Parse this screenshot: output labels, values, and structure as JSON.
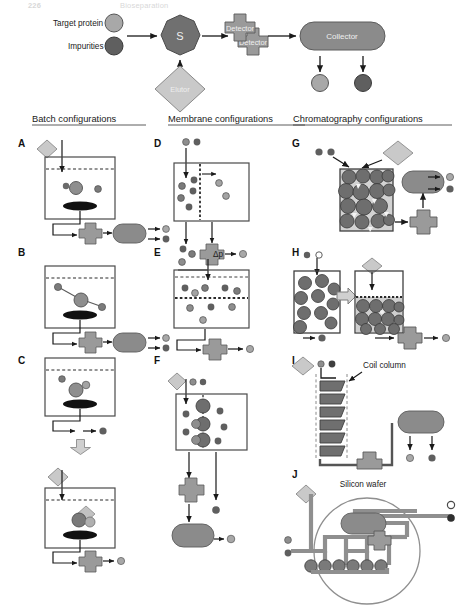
{
  "header": {
    "page_number": "226",
    "running_title": "Bioseparation"
  },
  "legend": {
    "target_protein_label": "Target protein",
    "impurities_label": "Impurities",
    "separator_label": "S",
    "detector_label": "Detector",
    "detector_label_2": "Detector",
    "collector_label": "Collector",
    "elutor_label": "Elutor"
  },
  "columns": [
    {
      "id": "batch",
      "title": "Batch configurations"
    },
    {
      "id": "membrane",
      "title": "Membrane configurations"
    },
    {
      "id": "chromatography",
      "title": "Chromatography configurations"
    }
  ],
  "panels": [
    {
      "id": "A",
      "label": "A",
      "column": "batch",
      "caption": "Stirred batch vessel with elutor addition, magnetic settling bar, detector and collector"
    },
    {
      "id": "B",
      "label": "B",
      "column": "batch",
      "caption": "Batch vessel with particle aggregation chain, magnet, detector and collector"
    },
    {
      "id": "C",
      "label": "C",
      "column": "batch",
      "caption": "Two-stage batch: wash stage then elution stage with detector"
    },
    {
      "id": "D",
      "label": "D",
      "column": "membrane",
      "caption": "Cross-flow membrane module with vertical membrane and detector"
    },
    {
      "id": "E",
      "label": "E",
      "column": "membrane",
      "caption": "Dead-end membrane filtration driven by pressure difference",
      "annotation": "Δp"
    },
    {
      "id": "F",
      "label": "F",
      "column": "membrane",
      "caption": "Membrane adsorber column with bound particle clusters, detector and collector"
    },
    {
      "id": "G",
      "label": "G",
      "column": "chromatography",
      "caption": "Packed bed chromatography column with detector and collector"
    },
    {
      "id": "H",
      "label": "H",
      "column": "chromatography",
      "caption": "Expanded bed converted to settled packed bed, then detector"
    },
    {
      "id": "I",
      "label": "I",
      "column": "chromatography",
      "caption": "Coil column chromatography with detector and collector",
      "annotation": "Coil column"
    },
    {
      "id": "J",
      "label": "J",
      "column": "chromatography",
      "caption": "Silicon wafer microfluidic chip with chambers, detector and collector",
      "annotation": "Silicon wafer"
    }
  ],
  "annotations": {
    "delta_p": "Δp",
    "coil_column": "Coil column",
    "silicon_wafer": "Silicon wafer"
  },
  "colors": {
    "target_protein": "#a8a8a8",
    "impurities": "#5f5f5f",
    "separator": "#707070",
    "detector": "#9a9a9a",
    "collector": "#8b8b8b",
    "elutor": "#c9c9c9",
    "bead": "#6e6e6e",
    "vessel_stroke": "#4a4a4a",
    "channel": "#8a8a8a",
    "arrow": "#1a1a1a",
    "magnet": "#111111"
  }
}
